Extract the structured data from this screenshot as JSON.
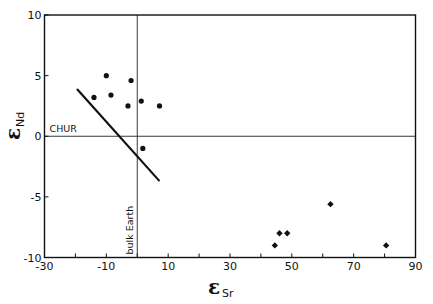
{
  "chart_data": {
    "type": "scatter",
    "title": "",
    "xlabel": "εSr",
    "ylabel": "εNd",
    "xlabel_symbol": "ε",
    "xlabel_sub": "Sr",
    "ylabel_symbol": "ε",
    "ylabel_sub": "Nd",
    "xlim": [
      -30,
      90
    ],
    "ylim": [
      -10,
      10
    ],
    "xticks_major": [
      -30,
      -10,
      10,
      30,
      50,
      70,
      90
    ],
    "xticks_minor": [
      -20,
      0,
      20,
      40,
      60,
      80
    ],
    "yticks": [
      -10,
      -5,
      0,
      5,
      10
    ],
    "grid": false,
    "reference_lines": [
      {
        "orientation": "horizontal",
        "value": 0,
        "label": "CHUR"
      },
      {
        "orientation": "vertical",
        "value": 0,
        "label": "bulk Earth"
      }
    ],
    "series": [
      {
        "name": "circles",
        "marker": "circle",
        "points": [
          {
            "x": -14,
            "y": 3.2
          },
          {
            "x": -10,
            "y": 5.0
          },
          {
            "x": -8.5,
            "y": 3.4
          },
          {
            "x": -3,
            "y": 2.5
          },
          {
            "x": -2,
            "y": 4.6
          },
          {
            "x": 1.3,
            "y": 2.9
          },
          {
            "x": 7.2,
            "y": 2.5
          },
          {
            "x": 1.8,
            "y": -1.0
          }
        ]
      },
      {
        "name": "diamonds",
        "marker": "diamond",
        "points": [
          {
            "x": 44.5,
            "y": -9.0
          },
          {
            "x": 46,
            "y": -8.0
          },
          {
            "x": 48.5,
            "y": -8.0
          },
          {
            "x": 62.5,
            "y": -5.6
          },
          {
            "x": 80.5,
            "y": -9.0
          }
        ]
      },
      {
        "name": "trend line",
        "marker": "line",
        "points": [
          {
            "x": -19.5,
            "y": 3.9
          },
          {
            "x": 7.2,
            "y": -3.7
          }
        ]
      }
    ]
  }
}
